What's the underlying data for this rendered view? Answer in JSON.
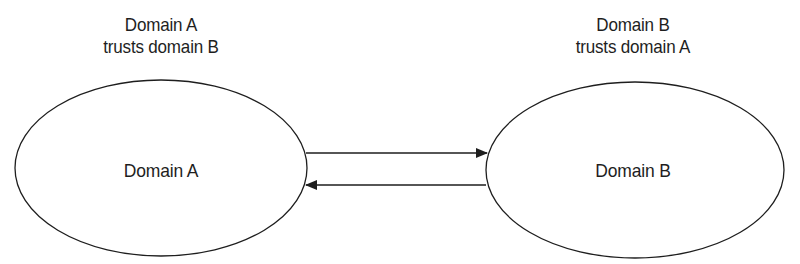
{
  "diagram": {
    "colors": {
      "stroke": "#1e1e1e",
      "background": "#ffffff",
      "text": "#1e1e1e"
    },
    "nodes": [
      {
        "id": "domain-a",
        "label": "Domain A",
        "caption_line1": "Domain A",
        "caption_line2": "trusts domain B",
        "shape": "ellipse",
        "cx": 161,
        "cy": 168,
        "rx": 146,
        "ry": 88
      },
      {
        "id": "domain-b",
        "label": "Domain B",
        "caption_line1": "Domain B",
        "caption_line2": "trusts domain A",
        "shape": "ellipse",
        "cx": 635,
        "cy": 170,
        "rx": 149,
        "ry": 88
      }
    ],
    "edges": [
      {
        "from": "domain-a",
        "to": "domain-b",
        "direction": "right",
        "x1": 306,
        "y1": 153,
        "x2": 487,
        "y2": 153
      },
      {
        "from": "domain-b",
        "to": "domain-a",
        "direction": "left",
        "x1": 486,
        "y1": 185,
        "x2": 306,
        "y2": 185
      }
    ]
  }
}
